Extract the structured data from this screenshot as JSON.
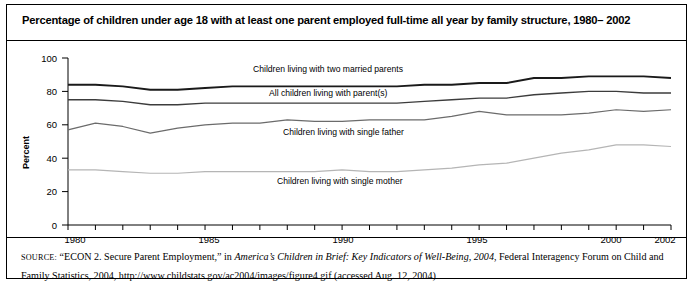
{
  "title": "Percentage of children under age 18 with at least one parent employed full-time all year by family structure, 1980– 2002",
  "axis": {
    "ylabel": "Percent",
    "yticks": [
      "0",
      "20",
      "40",
      "60",
      "80",
      "100"
    ],
    "xticks": [
      "1980",
      "1985",
      "1990",
      "1995",
      "2000",
      "2002"
    ]
  },
  "source": {
    "prefix": "SOURCE:",
    "part1": " “ECON 2. Secure Parent Employment,” in ",
    "italic1": "America’s Children in Brief: Key Indicators of Well-Being, 2004",
    "part2": ", Federal Interagency Forum on Child and Family Statistics, 2004, http://www.childstats.gov/ac2004/images/figure4.gif (accessed Aug. 12, 2004)"
  },
  "labels": {
    "married": "Children living with two married parents",
    "all": "All children living with parent(s)",
    "father": "Children living with single father",
    "mother": "Children living with single mother"
  },
  "colors": {
    "married": "#1a1a1a",
    "all": "#3c3c3c",
    "father": "#6b6b6b",
    "mother": "#b5b5b5",
    "axis": "#000000"
  },
  "chart_data": {
    "type": "line",
    "title": "Percentage of children under age 18 with at least one parent employed full-time all year by family structure, 1980– 2002",
    "xlabel": "",
    "ylabel": "Percent",
    "ylim": [
      0,
      100
    ],
    "xlim": [
      1980,
      2002
    ],
    "grid": false,
    "legend": "inline-annotations",
    "x": [
      1980,
      1981,
      1982,
      1983,
      1984,
      1985,
      1986,
      1987,
      1988,
      1989,
      1990,
      1991,
      1992,
      1993,
      1994,
      1995,
      1996,
      1997,
      1998,
      1999,
      2000,
      2001,
      2002
    ],
    "series": [
      {
        "name": "Children living with two married parents",
        "values": [
          84,
          84,
          83,
          81,
          81,
          82,
          83,
          83,
          83,
          83,
          83,
          83,
          83,
          84,
          84,
          85,
          85,
          88,
          88,
          89,
          89,
          89,
          88
        ]
      },
      {
        "name": "All children living with parent(s)",
        "values": [
          75,
          75,
          74,
          72,
          72,
          73,
          73,
          73,
          73,
          73,
          73,
          73,
          73,
          74,
          75,
          76,
          76,
          78,
          79,
          80,
          80,
          79,
          79
        ]
      },
      {
        "name": "Children living with single father",
        "values": [
          57,
          61,
          59,
          55,
          58,
          60,
          61,
          61,
          63,
          62,
          62,
          63,
          63,
          63,
          65,
          68,
          66,
          66,
          66,
          67,
          69,
          68,
          69
        ]
      },
      {
        "name": "Children living with single mother",
        "values": [
          33,
          33,
          32,
          31,
          31,
          32,
          32,
          32,
          32,
          32,
          33,
          32,
          32,
          33,
          34,
          36,
          37,
          40,
          43,
          45,
          48,
          48,
          47
        ]
      }
    ]
  }
}
